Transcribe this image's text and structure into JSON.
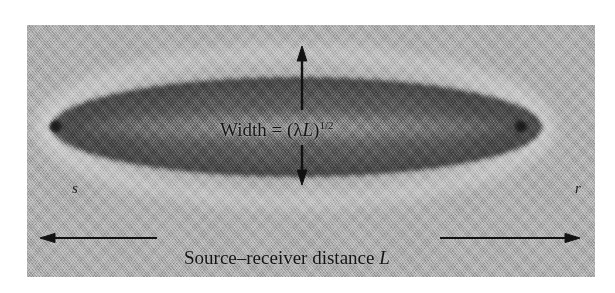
{
  "figure": {
    "domain": "diagram",
    "background_color": "#a9a9a9",
    "canvas_color": "#ffffff",
    "ink_color": "#141414"
  },
  "labels": {
    "source_point": "s",
    "receiver_point": "r"
  },
  "annotations": {
    "width": {
      "prefix": "Width = (",
      "lambda": "λ",
      "length_var": "L",
      "close_paren": ")",
      "exponent": "1/2",
      "full_text": "Width = (λL)1/2"
    },
    "distance": {
      "text": "Source–receiver distance",
      "length_var": "L",
      "full_text": "Source–receiver distance L"
    }
  },
  "arrows": {
    "width_arrow": {
      "name": "vertical-double-arrow",
      "direction": "vertical",
      "heads": "both",
      "top_y": 23,
      "bottom_y": 158
    },
    "distance_arrow": {
      "name": "horizontal-double-arrow",
      "direction": "horizontal",
      "heads": "both",
      "left_x": 13,
      "right_x": 553
    }
  },
  "geometry": {
    "panel": {
      "x": 27,
      "y": 25,
      "width": 568,
      "height": 252
    },
    "ellipse": {
      "cx": 270,
      "cy": 102,
      "rx": 245,
      "ry": 50
    },
    "source_tip": {
      "x": 28,
      "y": 102
    },
    "receiver_tip": {
      "x": 493,
      "y": 102
    }
  }
}
